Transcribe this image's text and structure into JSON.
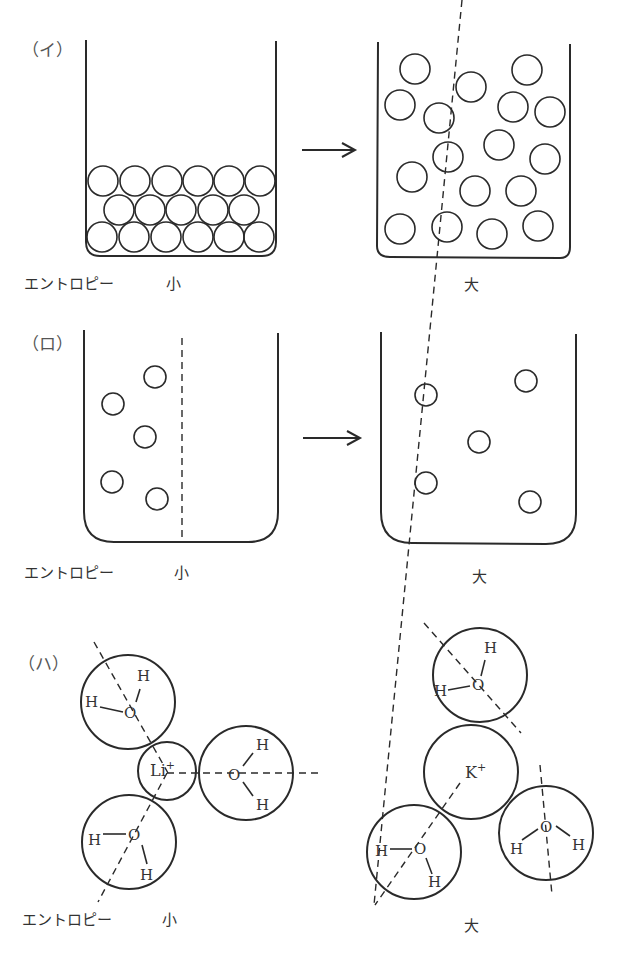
{
  "panels": [
    {
      "id": "i",
      "label": "（イ）",
      "description": "solid packed particles -> gas dispersed particles",
      "entropy_label": "エントロピー",
      "left_value": "小",
      "right_value": "大"
    },
    {
      "id": "ro",
      "label": "（ロ）",
      "description": "gas confined by partition -> gas spread through whole container",
      "entropy_label": "エントロピー",
      "left_value": "小",
      "right_value": "大"
    },
    {
      "id": "ha",
      "label": "（ハ）",
      "description": "hydrated Li+ vs hydrated K+",
      "entropy_label": "エントロピー",
      "left_value": "小",
      "right_value": "大",
      "left_ion": "Li",
      "right_ion": "K",
      "ion_charge": "+",
      "atoms": {
        "oxygen": "O",
        "hydrogen": "H"
      }
    }
  ]
}
